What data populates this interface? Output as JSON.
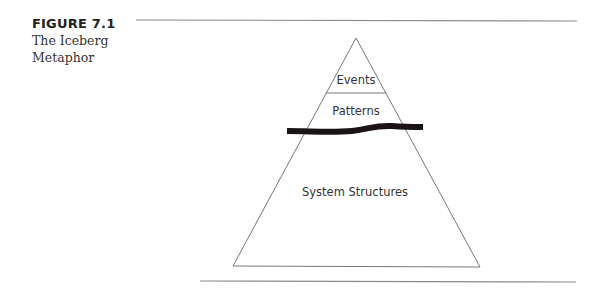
{
  "figure": {
    "number": "FIGURE 7.1",
    "title_line1": "The Iceberg",
    "title_line2": "Metaphor"
  },
  "diagram": {
    "type": "iceberg-pyramid",
    "levels": [
      {
        "label": "Events",
        "position": "top, above waterline"
      },
      {
        "label": "Patterns",
        "position": "middle, at waterline"
      },
      {
        "label": "System Structures",
        "position": "bottom, below waterline"
      }
    ],
    "waterline": "thick black wavy line",
    "colors": {
      "lines": "#777777",
      "waterline": "#1a1416",
      "rules": "#888888",
      "text": "#333333"
    }
  }
}
